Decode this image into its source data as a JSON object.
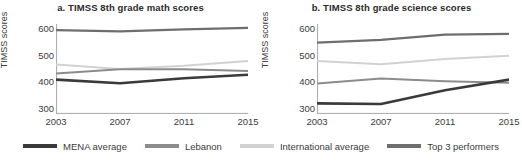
{
  "legend": {
    "position": "bottom-center",
    "items": [
      {
        "label": "MENA average",
        "key": "mena",
        "color": "#3a3a3a",
        "swatch_name": "legend-swatch-mena"
      },
      {
        "label": "Lebanon",
        "key": "lebanon",
        "color": "#8c8c8c",
        "swatch_name": "legend-swatch-lebanon"
      },
      {
        "label": "International average",
        "key": "international",
        "color": "#d2d2d2",
        "swatch_name": "legend-swatch-international"
      },
      {
        "label": "Top 3 performers",
        "key": "top3",
        "color": "#6e6e6e",
        "swatch_name": "legend-swatch-top3"
      }
    ]
  },
  "chart_data": [
    {
      "type": "line",
      "panel": "a",
      "title": "a. TIMSS 8th grade math scores",
      "xlabel": "",
      "ylabel": "TIMSS scores",
      "x": [
        2003,
        2007,
        2011,
        2015
      ],
      "xticklabels": [
        "2003",
        "2007",
        "2011",
        "2015"
      ],
      "yticks": [
        300,
        400,
        500,
        600
      ],
      "yticklabels": [
        "300",
        "400",
        "500",
        "600"
      ],
      "ylim": [
        280,
        620
      ],
      "xlim": [
        2003,
        2015
      ],
      "grid": false,
      "series": [
        {
          "name": "MENA average",
          "color": "#3a3a3a",
          "width": 2.6,
          "values": [
            410,
            396,
            415,
            428
          ]
        },
        {
          "name": "Lebanon",
          "color": "#8c8c8c",
          "width": 2.0,
          "values": [
            433,
            449,
            449,
            442
          ]
        },
        {
          "name": "International average",
          "color": "#d2d2d2",
          "width": 2.0,
          "values": [
            467,
            450,
            462,
            480
          ]
        },
        {
          "name": "Top 3 performers",
          "color": "#6e6e6e",
          "width": 2.2,
          "values": [
            597,
            592,
            600,
            605
          ]
        }
      ]
    },
    {
      "type": "line",
      "panel": "b",
      "title": "b. TIMSS 8th grade science scores",
      "xlabel": "",
      "ylabel": "TIMSS scores",
      "x": [
        2003,
        2007,
        2011,
        2015
      ],
      "xticklabels": [
        "2003",
        "2007",
        "2011",
        "2015"
      ],
      "yticks": [
        300,
        400,
        500,
        600
      ],
      "yticklabels": [
        "300",
        "400",
        "500",
        "600"
      ],
      "ylim": [
        280,
        620
      ],
      "xlim": [
        2003,
        2015
      ],
      "grid": false,
      "series": [
        {
          "name": "MENA average",
          "color": "#3a3a3a",
          "width": 2.6,
          "values": [
            320,
            318,
            370,
            410
          ]
        },
        {
          "name": "Lebanon",
          "color": "#8c8c8c",
          "width": 2.0,
          "values": [
            395,
            414,
            404,
            398
          ]
        },
        {
          "name": "International average",
          "color": "#d2d2d2",
          "width": 2.0,
          "values": [
            480,
            468,
            488,
            500
          ]
        },
        {
          "name": "Top 3 performers",
          "color": "#6e6e6e",
          "width": 2.2,
          "values": [
            550,
            560,
            580,
            583
          ]
        }
      ]
    }
  ],
  "style": {
    "axis_color": "#a8a8a8",
    "text_color": "#3c3c3c",
    "background": "#ffffff"
  }
}
